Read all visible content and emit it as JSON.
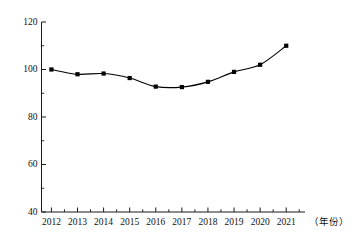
{
  "chart_data": {
    "type": "line",
    "title": "",
    "subtitle": "",
    "xlabel": "（年份）",
    "ylabel": "",
    "categories": [
      "2012",
      "2013",
      "2014",
      "2015",
      "2016",
      "2017",
      "2018",
      "2019",
      "2020",
      "2021"
    ],
    "x": [
      2012,
      2013,
      2014,
      2015,
      2016,
      2017,
      2018,
      2019,
      2020,
      2021
    ],
    "values": [
      100,
      98,
      98.3,
      96.4,
      92.8,
      92.6,
      94.8,
      99,
      102,
      110
    ],
    "series": [
      {
        "name": "",
        "values": [
          100,
          98,
          98.3,
          96.4,
          92.8,
          92.6,
          94.8,
          99,
          102,
          110
        ]
      }
    ],
    "ylim": [
      40,
      120
    ],
    "yticks": [
      40,
      60,
      80,
      100,
      120
    ],
    "ytick_labels": [
      "40",
      "60",
      "80",
      "100",
      "120"
    ],
    "yminor_step": 10,
    "xlim": [
      2011.6,
      2021.7
    ],
    "grid": false,
    "legend": false,
    "legend_position": "none",
    "marker": "square",
    "marker_color": "#000000",
    "line_color": "#000000",
    "axis_color": "#1a1a1a",
    "background": "#ffffff"
  },
  "axis": {
    "y_labels": [
      "120",
      "100",
      "80",
      "60",
      "40"
    ],
    "x_labels": [
      "2012",
      "2013",
      "2014",
      "2015",
      "2016",
      "2017",
      "2018",
      "2019",
      "2020",
      "2021"
    ],
    "x_caption": "（年份）"
  }
}
